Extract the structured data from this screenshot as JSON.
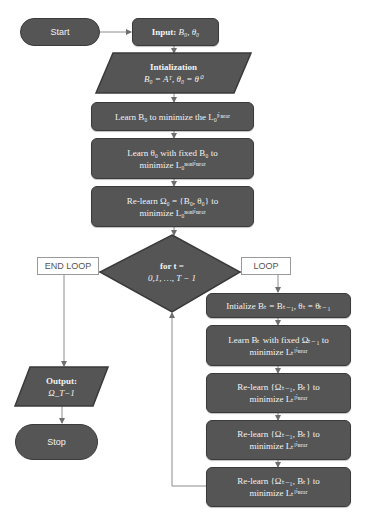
{
  "colors": {
    "node_fill": "#555555",
    "node_border": "#3a3a3a",
    "connector": "#8c8c8c",
    "node_text": "#f2f2f2"
  },
  "start": {
    "label": "Start"
  },
  "input": {
    "title": "Input:",
    "value": "B₀, θ₀"
  },
  "init": {
    "title": "Intialization",
    "formula": "B₀ = Aᵀ, θ₀ = θ⁰"
  },
  "step_learn_b0": {
    "line1": "Learn B₀ to minimize the L₀ˡⁱⁿᵉᵃʳ"
  },
  "step_learn_theta0": {
    "line1": "Learn θ₀ with fixed B₀ to",
    "line2": "minimize L₀ⁿᵒⁿˡⁱⁿᵉᵃʳ"
  },
  "step_relearn_omega0": {
    "line1": "Re-learn Ω₀ = {B₀, θ₀} to",
    "line2": "minimize L₀ⁿᵒⁿˡⁱⁿᵉᵃʳ"
  },
  "loop_decision": {
    "line1": "for  t =",
    "line2": "0,1, …, T − 1"
  },
  "end_loop_label": "END LOOP",
  "loop_label": "LOOP",
  "loop_steps": [
    {
      "line1": "Intialize Bₜ = Bₜ₋₁, θₜ = θₜ₋₁",
      "line2": ""
    },
    {
      "line1": "Learn Bₜ with fixed Ωₜ₋₁ to",
      "line2": "minimize Lₜˡⁱⁿᵉᵃʳ"
    },
    {
      "line1": "Re-learn {Ωₜ₋₁, Bₜ} to",
      "line2": "minimize Lₜˡⁱⁿᵉᵃʳ"
    },
    {
      "line1": "Re-learn {Ωₜ₋₁, Bₜ} to",
      "line2": "minimize Lₜˡⁱⁿᵉᵃʳ"
    },
    {
      "line1": "Re-learn {Ωₜ₋₁, Bₜ} to",
      "line2": "minimize Lₜˡⁱⁿᵉᵃʳ"
    }
  ],
  "output": {
    "title": "Output:",
    "value": "Ω_T−1"
  },
  "stop": {
    "label": "Stop"
  }
}
